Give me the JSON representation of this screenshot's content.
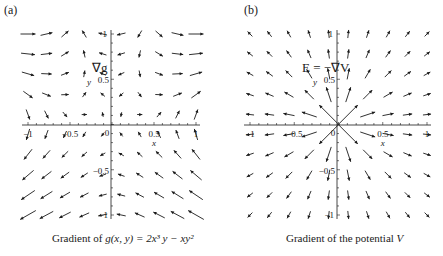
{
  "panels": {
    "a": {
      "label": "(a)",
      "annotation": "∇g",
      "caption_prefix": "Gradient of ",
      "caption_math": "g(x, y) = 2x³ y − xy²",
      "xlabel": "x",
      "ylabel": "y"
    },
    "b": {
      "label": "(b)",
      "annotation": "E = −∇V",
      "caption_prefix": "Gradient of the potential ",
      "caption_math": "V",
      "xlabel": "x",
      "ylabel": "y"
    }
  },
  "chart_data": [
    {
      "type": "vector_field",
      "title": "Gradient of g(x, y) = 2x^3 y − xy^2",
      "panel_label": "(a)",
      "annotation": "∇g",
      "xlabel": "x",
      "ylabel": "y",
      "xlim": [
        -1,
        1
      ],
      "ylim": [
        -1,
        1
      ],
      "xticks": [
        -1,
        -0.5,
        0,
        0.5,
        1
      ],
      "yticks": [
        -1,
        -0.5,
        0.5,
        1
      ],
      "grid": false,
      "field": {
        "fx": "6x^2 y - y^2",
        "fy": "2x^3 - 2xy"
      },
      "x": [
        -1,
        -0.78,
        -0.56,
        -0.33,
        -0.11,
        0.11,
        0.33,
        0.56,
        0.78,
        1
      ],
      "y": [
        1,
        0.78,
        0.56,
        0.33,
        0.11,
        -0.11,
        -0.33,
        -0.56,
        -0.78,
        -1
      ]
    },
    {
      "type": "vector_field",
      "title": "Gradient of the potential V",
      "panel_label": "(b)",
      "annotation": "E = −∇V",
      "xlabel": "x",
      "ylabel": "y",
      "xlim": [
        -1,
        1
      ],
      "ylim": [
        -1,
        1
      ],
      "xticks": [
        -1,
        -0.5,
        0,
        0.5,
        1
      ],
      "yticks": [
        -1,
        -0.5,
        0.5,
        1
      ],
      "grid": false,
      "field": {
        "description": "radial field pointing outward from origin, magnitude decaying with distance (point charge)",
        "fx": "x/r^3",
        "fy": "y/r^3"
      },
      "x": [
        -1,
        -0.78,
        -0.56,
        -0.33,
        -0.11,
        0.11,
        0.33,
        0.56,
        0.78,
        1
      ],
      "y": [
        1,
        0.78,
        0.56,
        0.33,
        0.11,
        -0.11,
        -0.33,
        -0.56,
        -0.78,
        -1
      ]
    }
  ]
}
